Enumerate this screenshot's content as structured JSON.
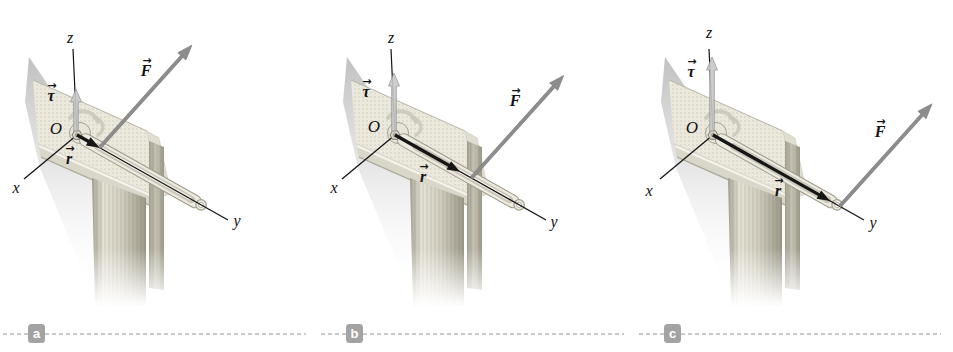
{
  "figure": {
    "type": "physics-diagram",
    "vector_arrow_glyph": "→",
    "colors": {
      "force_arrow": "#8d8d8d",
      "force_arrow_outline": "#6f6f6f",
      "torque_arrow": "#c9c9c9",
      "torque_arrow_outline": "#909090",
      "position_arrow": "#161616",
      "axis_line": "#141414",
      "badge_background": "#a3a3a3",
      "badge_text": "#ffffff",
      "table_wood": "#ebe8dc"
    },
    "panels": [
      {
        "letter": "a",
        "torque_arrow_length": 46,
        "position_vector_length": 26,
        "force_tail_t": 26,
        "labels": {
          "z": {
            "text": "z",
            "x": 70,
            "y": 38,
            "vec": false
          },
          "x": {
            "text": "x",
            "x": 16,
            "y": 188,
            "vec": false
          },
          "y": {
            "text": "y",
            "x": 237,
            "y": 221,
            "vec": false
          },
          "O": {
            "text": "O",
            "x": 56,
            "y": 128,
            "vec": false
          },
          "tau": {
            "text": "τ",
            "x": 51,
            "y": 96,
            "vec": true
          },
          "F": {
            "text": "F",
            "x": 146,
            "y": 71,
            "vec": true
          },
          "r": {
            "text": "r",
            "x": 69,
            "y": 159,
            "vec": true
          }
        }
      },
      {
        "letter": "b",
        "torque_arrow_length": 62,
        "position_vector_length": 75,
        "force_tail_t": 88,
        "labels": {
          "z": {
            "text": "z",
            "x": 73,
            "y": 38,
            "vec": false
          },
          "x": {
            "text": "x",
            "x": 16,
            "y": 188,
            "vec": false
          },
          "y": {
            "text": "y",
            "x": 236,
            "y": 222,
            "vec": false
          },
          "O": {
            "text": "O",
            "x": 56,
            "y": 126,
            "vec": false
          },
          "tau": {
            "text": "τ",
            "x": 48,
            "y": 92,
            "vec": true
          },
          "F": {
            "text": "F",
            "x": 197,
            "y": 101,
            "vec": true
          },
          "r": {
            "text": "r",
            "x": 105,
            "y": 177,
            "vec": true
          }
        }
      },
      {
        "letter": "c",
        "torque_arrow_length": 78,
        "position_vector_length": 135,
        "force_tail_t": 146,
        "labels": {
          "z": {
            "text": "z",
            "x": 73,
            "y": 33,
            "vec": false
          },
          "x": {
            "text": "x",
            "x": 13,
            "y": 191,
            "vec": false
          },
          "y": {
            "text": "y",
            "x": 237,
            "y": 223,
            "vec": false
          },
          "O": {
            "text": "O",
            "x": 56,
            "y": 127,
            "vec": false
          },
          "tau": {
            "text": "τ",
            "x": 55,
            "y": 72,
            "vec": true
          },
          "F": {
            "text": "F",
            "x": 244,
            "y": 132,
            "vec": true
          },
          "r": {
            "text": "r",
            "x": 142,
            "y": 191,
            "vec": true
          }
        }
      }
    ]
  }
}
